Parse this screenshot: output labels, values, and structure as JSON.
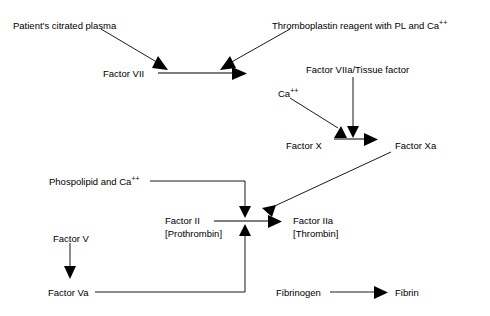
{
  "diagram": {
    "background_color": "#ffffff",
    "stroke_color": "#000000",
    "text_color": "#000000",
    "nodes": [
      {
        "id": "patient-plasma",
        "label": "Patient's citrated plasma",
        "x": 13,
        "y": 20
      },
      {
        "id": "thromboplastin",
        "label": "Thromboplastin reagent with PL and Ca",
        "sup": "++",
        "x": 272,
        "y": 20
      },
      {
        "id": "factor-vii",
        "label": "Factor VII",
        "x": 103,
        "y": 68
      },
      {
        "id": "factor-viia-tissue",
        "label": "Factor VIIa/Tissue factor",
        "x": 306,
        "y": 64
      },
      {
        "id": "calcium-ion",
        "label": "Ca",
        "sup": "++",
        "x": 278,
        "y": 88
      },
      {
        "id": "factor-x",
        "label": "Factor X",
        "x": 286,
        "y": 140
      },
      {
        "id": "factor-xa",
        "label": "Factor Xa",
        "x": 395,
        "y": 140
      },
      {
        "id": "phospholipid-calcium",
        "label": "Phospolipid and Ca",
        "sup": "++",
        "x": 49,
        "y": 176
      },
      {
        "id": "factor-ii",
        "label": "Factor II",
        "line2": "[Prothrombin]",
        "x": 165,
        "y": 222
      },
      {
        "id": "factor-iia",
        "label": "Factor IIa",
        "line2": "[Thrombin]",
        "x": 293,
        "y": 222
      },
      {
        "id": "factor-v",
        "label": "Factor V",
        "x": 53,
        "y": 233
      },
      {
        "id": "factor-va",
        "label": "Factor Va",
        "x": 48,
        "y": 287
      },
      {
        "id": "fibrinogen",
        "label": "Fibrinogen",
        "x": 276,
        "y": 287
      },
      {
        "id": "fibrin",
        "label": "Fibrin",
        "x": 395,
        "y": 287
      }
    ],
    "edges": [
      {
        "id": "plasma-to-factor-vii",
        "from": "patient-plasma",
        "to": "factor-vii",
        "kind": "diagonal"
      },
      {
        "id": "thromboplastin-to-factor-vii",
        "from": "thromboplastin",
        "to": "factor-vii",
        "kind": "diagonal"
      },
      {
        "id": "factor-vii-activation",
        "from": "factor-vii",
        "to": "factor-viia",
        "kind": "horizontal"
      },
      {
        "id": "calcium-to-factor-x",
        "from": "calcium-ion",
        "to": "factor-x",
        "kind": "diagonal"
      },
      {
        "id": "tissue-factor-to-factor-x",
        "from": "factor-viia-tissue",
        "to": "factor-x",
        "kind": "vertical"
      },
      {
        "id": "factor-x-to-factor-xa",
        "from": "factor-x",
        "to": "factor-xa",
        "kind": "horizontal"
      },
      {
        "id": "factor-xa-to-factor-ii",
        "from": "factor-xa",
        "to": "factor-ii",
        "kind": "diagonal"
      },
      {
        "id": "phospholipid-to-factor-ii",
        "from": "phospholipid-calcium",
        "to": "factor-ii",
        "kind": "elbow-down"
      },
      {
        "id": "factor-ii-to-factor-iia",
        "from": "factor-ii",
        "to": "factor-iia",
        "kind": "horizontal"
      },
      {
        "id": "factor-v-to-factor-va",
        "from": "factor-v",
        "to": "factor-va",
        "kind": "vertical"
      },
      {
        "id": "factor-va-to-factor-ii",
        "from": "factor-va",
        "to": "factor-ii",
        "kind": "elbow-up"
      },
      {
        "id": "fibrinogen-to-fibrin",
        "from": "fibrinogen",
        "to": "fibrin",
        "kind": "horizontal"
      }
    ]
  }
}
